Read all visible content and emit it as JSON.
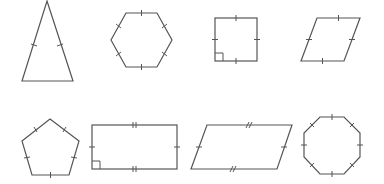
{
  "diagram": {
    "stroke_color": "#555555",
    "background": "#ffffff",
    "shapes": [
      {
        "name": "isosceles-triangle",
        "points": [
          [
            47,
            1
          ],
          [
            73,
            81
          ],
          [
            22,
            81
          ]
        ],
        "ticks": "single marks on two equal legs"
      },
      {
        "name": "regular-hexagon",
        "points": [
          [
            126,
            13
          ],
          [
            157,
            13
          ],
          [
            172,
            40
          ],
          [
            157,
            67
          ],
          [
            126,
            67
          ],
          [
            111,
            40
          ]
        ],
        "ticks": "single mark on all 6 sides"
      },
      {
        "name": "square",
        "points": [
          [
            215,
            18
          ],
          [
            257,
            18
          ],
          [
            257,
            61
          ],
          [
            215,
            61
          ]
        ],
        "ticks": "single mark on all 4 sides",
        "right_angle": "bottom-left"
      },
      {
        "name": "rhombus",
        "points": [
          [
            317,
            18
          ],
          [
            360,
            18
          ],
          [
            344,
            61
          ],
          [
            301,
            61
          ]
        ],
        "ticks": "single mark on all 4 sides"
      },
      {
        "name": "regular-pentagon",
        "points": [
          [
            50,
            119
          ],
          [
            79,
            141
          ],
          [
            69,
            175
          ],
          [
            32,
            175
          ],
          [
            22,
            141
          ]
        ],
        "ticks": "single mark on all 5 sides"
      },
      {
        "name": "rectangle",
        "points": [
          [
            92,
            125
          ],
          [
            177,
            125
          ],
          [
            177,
            169
          ],
          [
            92,
            169
          ]
        ],
        "ticks": "double marks on long sides, single on short sides",
        "right_angle": "bottom-left"
      },
      {
        "name": "parallelogram",
        "points": [
          [
            207,
            125
          ],
          [
            292,
            125
          ],
          [
            277,
            169
          ],
          [
            191,
            169
          ]
        ],
        "ticks": "double marks on long sides, single on short sides"
      },
      {
        "name": "regular-octagon",
        "points": [
          [
            320,
            117
          ],
          [
            344,
            117
          ],
          [
            360,
            133
          ],
          [
            360,
            157
          ],
          [
            344,
            174
          ],
          [
            320,
            174
          ],
          [
            304,
            157
          ],
          [
            304,
            133
          ]
        ],
        "ticks": "single mark on all 8 sides"
      }
    ]
  }
}
